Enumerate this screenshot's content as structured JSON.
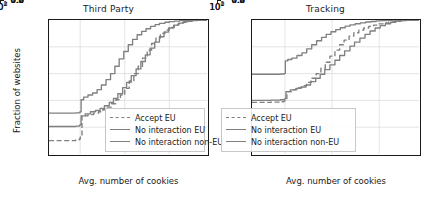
{
  "figure": {
    "width": 434,
    "height": 198,
    "background": "#ffffff"
  },
  "style": {
    "line_color": "#808080",
    "axis_color": "#1a1a1a",
    "grid_color": "#d9d9d9",
    "legend_border": "#c8c8c8"
  },
  "axes": {
    "ylabel": "Fraction of websites",
    "xlabel": "Avg. number of cookies",
    "yticks": [
      "1.0",
      "0.8",
      "0.6",
      "0.4",
      "0.2",
      "0.0"
    ],
    "ytick_values": [
      1.0,
      0.8,
      0.6,
      0.4,
      0.2,
      0.0
    ],
    "xticks": [
      {
        "base": "10",
        "exp": "0",
        "value": 1
      },
      {
        "base": "10",
        "exp": "1",
        "value": 10
      },
      {
        "base": "10",
        "exp": "2",
        "value": 100
      }
    ]
  },
  "legend": {
    "items": [
      {
        "label": "Accept EU",
        "style": "dashed"
      },
      {
        "label": "No interaction EU",
        "style": "solid"
      },
      {
        "label": "No interaction non-EU",
        "style": "solid"
      }
    ]
  },
  "chart_data": [
    {
      "type": "line",
      "title": "Third Party",
      "xlabel": "Avg. number of cookies",
      "ylabel": "Fraction of websites",
      "xscale": "log",
      "xlim": [
        0.2,
        700
      ],
      "ylim": [
        0.0,
        1.0
      ],
      "grid": true,
      "legend_position": "lower right",
      "series": [
        {
          "name": "Accept EU",
          "style": "dashed",
          "color": "#808080",
          "x": [
            0.2,
            0.5,
            0.8,
            0.95,
            1.0,
            1.1,
            1.5,
            2.0,
            2.6,
            3.2,
            4.0,
            5.0,
            6.3,
            8.0,
            10.0,
            12.6,
            16.0,
            20.0,
            25.0,
            32.0,
            40.0,
            50.0,
            63.0,
            80.0,
            100.0,
            130.0,
            160.0,
            200.0,
            260.0,
            320.0,
            420.0,
            700.0
          ],
          "y": [
            0.1,
            0.1,
            0.105,
            0.11,
            0.125,
            0.285,
            0.295,
            0.305,
            0.315,
            0.33,
            0.35,
            0.375,
            0.405,
            0.44,
            0.49,
            0.545,
            0.6,
            0.655,
            0.715,
            0.775,
            0.825,
            0.865,
            0.9,
            0.925,
            0.945,
            0.962,
            0.972,
            0.982,
            0.99,
            0.995,
            0.998,
            1.0
          ]
        },
        {
          "name": "No interaction EU",
          "style": "solid",
          "color": "#808080",
          "x": [
            0.2,
            0.5,
            0.8,
            0.95,
            1.0,
            1.05,
            1.2,
            1.5,
            1.9,
            2.4,
            3.0,
            3.8,
            4.8,
            6.0,
            7.5,
            9.5,
            12.0,
            15.0,
            19.0,
            24.0,
            30.0,
            38.0,
            48.0,
            60.0,
            80.0,
            100.0,
            130.0,
            170.0,
            220.0,
            300.0,
            420.0,
            700.0
          ],
          "y": [
            0.305,
            0.305,
            0.307,
            0.31,
            0.315,
            0.405,
            0.425,
            0.44,
            0.455,
            0.48,
            0.515,
            0.555,
            0.6,
            0.655,
            0.71,
            0.765,
            0.815,
            0.855,
            0.89,
            0.915,
            0.935,
            0.952,
            0.965,
            0.975,
            0.983,
            0.988,
            0.992,
            0.995,
            0.997,
            0.999,
            1.0,
            1.0
          ]
        },
        {
          "name": "No interaction non-EU",
          "style": "solid",
          "color": "#808080",
          "x": [
            0.2,
            0.5,
            0.8,
            0.95,
            1.0,
            1.05,
            1.3,
            1.7,
            2.2,
            2.8,
            3.5,
            4.5,
            5.6,
            7.0,
            9.0,
            11.0,
            14.0,
            18.0,
            23.0,
            29.0,
            37.0,
            47.0,
            60.0,
            76.0,
            96.0,
            125.0,
            160.0,
            210.0,
            270.0,
            350.0,
            460.0,
            700.0
          ],
          "y": [
            0.205,
            0.205,
            0.208,
            0.212,
            0.22,
            0.285,
            0.3,
            0.315,
            0.325,
            0.34,
            0.36,
            0.385,
            0.415,
            0.45,
            0.495,
            0.535,
            0.585,
            0.635,
            0.69,
            0.74,
            0.79,
            0.835,
            0.875,
            0.91,
            0.94,
            0.962,
            0.977,
            0.988,
            0.994,
            0.998,
            1.0,
            1.0
          ]
        }
      ]
    },
    {
      "type": "line",
      "title": "Tracking",
      "xlabel": "Avg. number of cookies",
      "ylabel": "Fraction of websites",
      "xscale": "log",
      "xlim": [
        0.2,
        700
      ],
      "ylim": [
        0.0,
        1.0
      ],
      "grid": true,
      "legend_position": "lower right",
      "series": [
        {
          "name": "Accept EU",
          "style": "dashed",
          "color": "#808080",
          "x": [
            0.2,
            0.5,
            0.8,
            0.95,
            1.0,
            1.1,
            1.4,
            1.8,
            2.3,
            2.9,
            3.6,
            4.6,
            5.8,
            7.2,
            9.0,
            11.5,
            14.5,
            18.0,
            23.0,
            29.0,
            37.0,
            47.0,
            60.0,
            76.0,
            96.0,
            125.0,
            160.0,
            210.0,
            270.0,
            350.0,
            460.0,
            700.0
          ],
          "y": [
            0.385,
            0.387,
            0.39,
            0.395,
            0.4,
            0.465,
            0.48,
            0.495,
            0.51,
            0.535,
            0.565,
            0.6,
            0.64,
            0.685,
            0.73,
            0.775,
            0.815,
            0.85,
            0.88,
            0.905,
            0.925,
            0.94,
            0.952,
            0.962,
            0.971,
            0.979,
            0.986,
            0.992,
            0.996,
            0.999,
            1.0,
            1.0
          ]
        },
        {
          "name": "No interaction EU",
          "style": "solid",
          "color": "#808080",
          "x": [
            0.2,
            0.5,
            0.8,
            0.95,
            1.0,
            1.02,
            1.15,
            1.4,
            1.8,
            2.3,
            2.9,
            3.7,
            4.7,
            6.0,
            7.5,
            9.5,
            12.0,
            15.0,
            19.0,
            24.0,
            31.0,
            40.0,
            52.0,
            67.0,
            86.0,
            110.0,
            145.0,
            190.0,
            250.0,
            330.0,
            440.0,
            700.0
          ],
          "y": [
            0.595,
            0.595,
            0.597,
            0.6,
            0.602,
            0.695,
            0.705,
            0.715,
            0.735,
            0.755,
            0.785,
            0.815,
            0.845,
            0.87,
            0.893,
            0.912,
            0.928,
            0.942,
            0.954,
            0.964,
            0.972,
            0.979,
            0.985,
            0.989,
            0.993,
            0.996,
            0.998,
            0.999,
            1.0,
            1.0,
            1.0,
            1.0
          ]
        },
        {
          "name": "No interaction non-EU",
          "style": "solid",
          "color": "#808080",
          "x": [
            0.2,
            0.5,
            0.8,
            0.95,
            1.0,
            1.05,
            1.3,
            1.7,
            2.2,
            2.8,
            3.5,
            4.5,
            5.6,
            7.0,
            9.0,
            11.5,
            14.5,
            18.5,
            24.0,
            30.0,
            39.0,
            50.0,
            64.0,
            82.0,
            105.0,
            135.0,
            175.0,
            225.0,
            290.0,
            380.0,
            490.0,
            700.0
          ],
          "y": [
            0.4,
            0.402,
            0.405,
            0.408,
            0.415,
            0.465,
            0.478,
            0.49,
            0.5,
            0.515,
            0.54,
            0.565,
            0.595,
            0.63,
            0.665,
            0.7,
            0.735,
            0.77,
            0.805,
            0.835,
            0.865,
            0.893,
            0.918,
            0.94,
            0.958,
            0.972,
            0.983,
            0.991,
            0.996,
            0.999,
            1.0,
            1.0
          ]
        }
      ]
    }
  ]
}
